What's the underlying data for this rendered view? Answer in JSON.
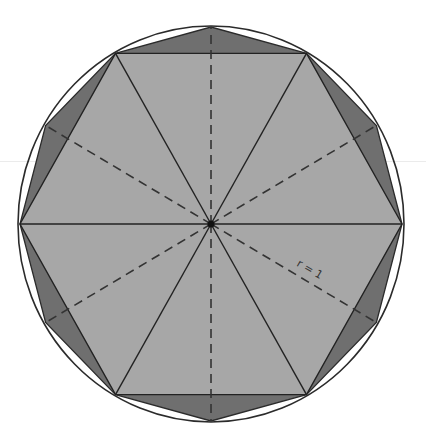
{
  "diagram": {
    "radius_label": "r = 1",
    "center": [
      211,
      224
    ],
    "rx": 191,
    "ry": 197,
    "shapes": {
      "circle": {
        "stroke": "#2b2b2b"
      },
      "dodecagon": {
        "fill": "#6f6f6f",
        "stroke": "#2b2b2b"
      },
      "hexagon": {
        "fill": "#a7a7a7",
        "stroke": "#222222"
      },
      "spokes_solid": {
        "stroke": "#222222",
        "count": 6
      },
      "spokes_dashed": {
        "stroke": "#333333",
        "count": 6
      }
    }
  }
}
